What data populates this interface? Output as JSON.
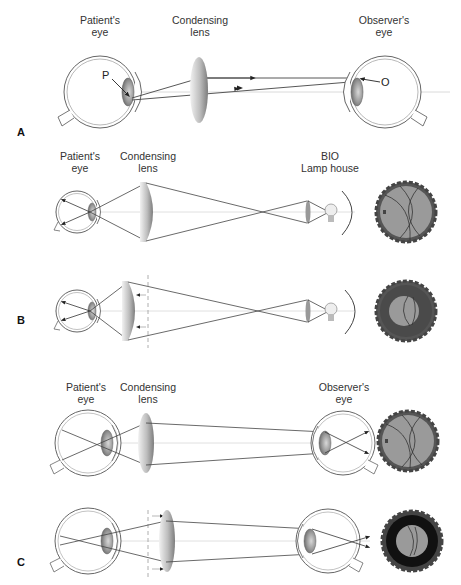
{
  "panel_a": {
    "letter": "A",
    "labels": {
      "patient_eye_1": "Patient's",
      "patient_eye_2": "eye",
      "condensing_1": "Condensing",
      "condensing_2": "lens",
      "observer_1": "Observer's",
      "observer_2": "eye",
      "point_p": "P",
      "point_o": "O"
    }
  },
  "panel_b": {
    "letter": "B",
    "labels": {
      "patient_eye_1": "Patient's",
      "patient_eye_2": "eye",
      "condensing_1": "Condensing",
      "condensing_2": "lens",
      "bio_1": "BIO",
      "bio_2": "Lamp house"
    }
  },
  "panel_c": {
    "letter": "C",
    "labels": {
      "patient_eye_1": "Patient's",
      "patient_eye_2": "eye",
      "condensing_1": "Condensing",
      "condensing_2": "lens",
      "observer_1": "Observer's",
      "observer_2": "eye"
    }
  },
  "colors": {
    "line": "#444444",
    "axis": "#cccccc",
    "fundus_fill": "#9a9a9a",
    "fundus_dark": "#555555",
    "fundus_black": "#111111"
  }
}
